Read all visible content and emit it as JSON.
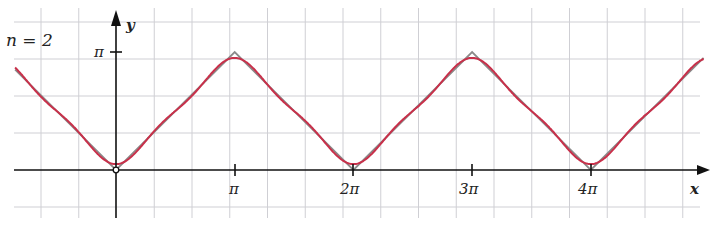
{
  "chart_data": {
    "type": "line",
    "title": "",
    "annotation": "n = 2",
    "xlabel": "x",
    "ylabel": "y",
    "x_ticks": [
      "π",
      "2π",
      "3π",
      "4π"
    ],
    "y_ticks": [
      "π"
    ],
    "xlim": [
      -0.85,
      4.95
    ],
    "ylim": [
      -0.4,
      1.3
    ],
    "units": "multiples of π",
    "grid": true,
    "series": [
      {
        "name": "f(x) = |x| periodic triangle wave",
        "color": "#8a8a8a",
        "x": [
          -0.85,
          0,
          1,
          2,
          3,
          4,
          4.95
        ],
        "y": [
          0.85,
          0,
          1,
          0,
          1,
          0,
          0.95
        ]
      },
      {
        "name": "Fourier partial sum n=2",
        "color": "#c8304a",
        "formula": "π/2 − (4/π)(cos x + cos 3x / 9)"
      }
    ]
  },
  "labels": {
    "n": "n = 2",
    "x_axis": "x",
    "y_axis": "y",
    "y_tick_pi": "π",
    "x_tick_1": "π",
    "x_tick_2": "2π",
    "x_tick_3": "3π",
    "x_tick_4": "4π"
  }
}
